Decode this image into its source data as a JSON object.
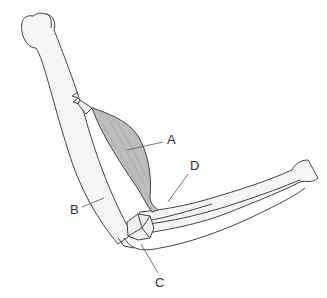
{
  "diagram": {
    "labels": [
      {
        "id": "A",
        "text": "A",
        "x": 167,
        "y": 133,
        "points_to": "biceps muscle belly"
      },
      {
        "id": "B",
        "text": "B",
        "x": 70,
        "y": 203,
        "points_to": "humerus shaft"
      },
      {
        "id": "C",
        "text": "C",
        "x": 155,
        "y": 276,
        "points_to": "elbow joint / olecranon"
      },
      {
        "id": "D",
        "text": "D",
        "x": 190,
        "y": 159,
        "points_to": "biceps tendon insertion"
      }
    ],
    "colors": {
      "outline": "#444444",
      "bone_fill": "#f4f4f4",
      "muscle_fill": "#bdbdbd",
      "leader": "#555555"
    }
  }
}
